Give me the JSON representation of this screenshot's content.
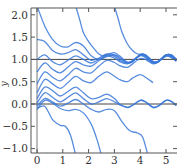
{
  "chart_data": {
    "type": "line",
    "title": "",
    "xlabel": "",
    "ylabel": "y",
    "xlim": [
      -0.22,
      5.4
    ],
    "ylim": [
      -1.1,
      2.15
    ],
    "xticks": [
      0,
      1,
      2,
      3,
      4,
      5
    ],
    "xtick_labels": [
      "0",
      "1",
      "2",
      "3",
      "4",
      "5"
    ],
    "yticks": [
      -1.0,
      -0.5,
      0.0,
      0.5,
      1.0,
      1.5,
      2.0
    ],
    "ytick_labels": [
      "−1.0",
      "−0.5",
      "0.0",
      "0.5",
      "1.0",
      "1.5",
      "2.0"
    ],
    "grid": false,
    "reference_lines": {
      "hline_y": [
        0,
        1
      ],
      "vline_x": [
        0
      ]
    },
    "line_color": "#3a78d8",
    "series": [
      {
        "name": "curve-1",
        "values": [
          [
            0,
            2.2
          ],
          [
            0.3,
            1.75
          ],
          [
            0.6,
            1.45
          ],
          [
            0.9,
            1.3
          ],
          [
            1.2,
            1.28
          ],
          [
            1.5,
            1.38
          ],
          [
            1.8,
            1.3
          ],
          [
            2.1,
            1.08
          ],
          [
            2.4,
            1.0
          ],
          [
            2.7,
            1.06
          ],
          [
            3.0,
            1.1
          ],
          [
            3.2,
            1.05
          ],
          [
            3.5,
            0.92
          ],
          [
            3.7,
            0.95
          ],
          [
            4.0,
            1.1
          ],
          [
            4.2,
            1.1
          ],
          [
            4.5,
            0.93
          ],
          [
            4.7,
            0.94
          ],
          [
            5.0,
            1.1
          ],
          [
            5.2,
            1.1
          ],
          [
            5.4,
            1.0
          ]
        ]
      },
      {
        "name": "curve-2",
        "values": [
          [
            0,
            1.45
          ],
          [
            0.3,
            1.4
          ],
          [
            0.6,
            1.2
          ],
          [
            0.9,
            1.12
          ],
          [
            1.2,
            1.15
          ],
          [
            1.5,
            1.22
          ],
          [
            1.8,
            1.1
          ],
          [
            2.1,
            0.98
          ],
          [
            2.4,
            1.03
          ],
          [
            2.7,
            1.12
          ],
          [
            3.0,
            1.1
          ],
          [
            3.2,
            1.02
          ],
          [
            3.5,
            0.93
          ],
          [
            3.7,
            0.96
          ],
          [
            4.0,
            1.1
          ],
          [
            4.2,
            1.08
          ],
          [
            4.5,
            0.93
          ],
          [
            4.7,
            0.95
          ],
          [
            5.0,
            1.1
          ],
          [
            5.2,
            1.08
          ],
          [
            5.4,
            0.98
          ]
        ]
      },
      {
        "name": "curve-3",
        "values": [
          [
            0,
            1.0
          ],
          [
            0.3,
            1.1
          ],
          [
            0.6,
            0.95
          ],
          [
            0.9,
            0.88
          ],
          [
            1.2,
            0.98
          ],
          [
            1.5,
            1.08
          ],
          [
            1.8,
            1.0
          ],
          [
            2.1,
            0.92
          ],
          [
            2.4,
            1.0
          ],
          [
            2.7,
            1.1
          ],
          [
            3.0,
            1.07
          ],
          [
            3.2,
            0.98
          ],
          [
            3.5,
            0.92
          ],
          [
            3.7,
            0.97
          ],
          [
            4.0,
            1.1
          ],
          [
            4.2,
            1.06
          ],
          [
            4.5,
            0.93
          ],
          [
            4.7,
            0.96
          ],
          [
            5.0,
            1.1
          ],
          [
            5.2,
            1.07
          ],
          [
            5.4,
            0.97
          ]
        ]
      },
      {
        "name": "curve-4",
        "values": [
          [
            0,
            0.72
          ],
          [
            0.3,
            0.92
          ],
          [
            0.6,
            0.78
          ],
          [
            0.9,
            0.7
          ],
          [
            1.2,
            0.83
          ],
          [
            1.5,
            0.95
          ],
          [
            1.8,
            0.88
          ],
          [
            2.1,
            0.85
          ],
          [
            2.4,
            0.97
          ],
          [
            2.7,
            1.08
          ],
          [
            3.0,
            1.03
          ],
          [
            3.2,
            0.95
          ],
          [
            3.5,
            0.9
          ],
          [
            3.7,
            0.97
          ],
          [
            4.0,
            1.08
          ],
          [
            4.2,
            1.04
          ],
          [
            4.5,
            0.92
          ],
          [
            4.7,
            0.96
          ],
          [
            5.0,
            1.08
          ],
          [
            5.2,
            1.05
          ],
          [
            5.4,
            0.96
          ]
        ]
      },
      {
        "name": "curve-5",
        "values": [
          [
            0,
            0.45
          ],
          [
            0.3,
            0.72
          ],
          [
            0.6,
            0.6
          ],
          [
            0.9,
            0.52
          ],
          [
            1.2,
            0.65
          ],
          [
            1.5,
            0.8
          ],
          [
            1.8,
            0.72
          ],
          [
            2.1,
            0.7
          ],
          [
            2.4,
            0.85
          ],
          [
            2.7,
            0.98
          ],
          [
            3.0,
            0.93
          ],
          [
            3.2,
            0.86
          ],
          [
            3.5,
            0.82
          ],
          [
            3.7,
            0.9
          ],
          [
            4.0,
            1.02
          ],
          [
            4.2,
            1.0
          ],
          [
            4.5,
            0.9
          ],
          [
            4.7,
            0.95
          ],
          [
            5.0,
            1.07
          ],
          [
            5.2,
            1.04
          ],
          [
            5.4,
            0.96
          ]
        ]
      },
      {
        "name": "curve-6",
        "values": [
          [
            0,
            0.25
          ],
          [
            0.3,
            0.55
          ],
          [
            0.6,
            0.45
          ],
          [
            0.9,
            0.35
          ],
          [
            1.2,
            0.48
          ],
          [
            1.5,
            0.62
          ],
          [
            1.8,
            0.52
          ],
          [
            2.1,
            0.48
          ],
          [
            2.4,
            0.62
          ],
          [
            2.7,
            0.72
          ],
          [
            3.0,
            0.62
          ],
          [
            3.2,
            0.55
          ],
          [
            3.5,
            0.5
          ],
          [
            3.7,
            0.58
          ],
          [
            4.0,
            0.66
          ],
          [
            4.2,
            0.6
          ],
          [
            4.5,
            0.48
          ]
        ]
      },
      {
        "name": "curve-7",
        "values": [
          [
            0,
            0.12
          ],
          [
            0.3,
            0.38
          ],
          [
            0.6,
            0.3
          ],
          [
            0.9,
            0.18
          ],
          [
            1.2,
            0.28
          ],
          [
            1.5,
            0.38
          ],
          [
            1.8,
            0.25
          ],
          [
            2.1,
            0.12
          ],
          [
            2.4,
            0.15
          ],
          [
            2.7,
            0.22
          ],
          [
            3.0,
            0.12
          ],
          [
            3.2,
            0.0
          ],
          [
            3.5,
            -0.08
          ],
          [
            3.7,
            -0.03
          ],
          [
            4.0,
            0.08
          ],
          [
            4.2,
            0.05
          ],
          [
            4.5,
            -0.08
          ],
          [
            4.7,
            -0.05
          ],
          [
            5.0,
            0.08
          ],
          [
            5.2,
            0.06
          ],
          [
            5.4,
            -0.04
          ]
        ]
      },
      {
        "name": "curve-8",
        "values": [
          [
            0,
            0.02
          ],
          [
            0.3,
            0.25
          ],
          [
            0.6,
            0.15
          ],
          [
            0.9,
            0.05
          ],
          [
            1.2,
            0.15
          ],
          [
            1.5,
            0.25
          ],
          [
            1.8,
            0.12
          ],
          [
            2.1,
            0.0
          ],
          [
            2.4,
            0.05
          ],
          [
            2.7,
            0.12
          ],
          [
            3.0,
            0.05
          ],
          [
            3.2,
            -0.02
          ],
          [
            3.5,
            -0.07
          ],
          [
            3.7,
            -0.03
          ],
          [
            4.0,
            0.08
          ],
          [
            4.2,
            0.05
          ],
          [
            4.5,
            -0.07
          ],
          [
            4.7,
            -0.04
          ],
          [
            5.0,
            0.08
          ],
          [
            5.2,
            0.06
          ],
          [
            5.4,
            -0.03
          ]
        ]
      },
      {
        "name": "curve-9",
        "values": [
          [
            0,
            -0.05
          ],
          [
            0.3,
            0.12
          ],
          [
            0.6,
            0.05
          ],
          [
            0.9,
            -0.05
          ],
          [
            1.2,
            0.02
          ],
          [
            1.5,
            0.1
          ],
          [
            1.8,
            0.0
          ],
          [
            2.1,
            -0.12
          ],
          [
            2.4,
            -0.18
          ],
          [
            2.7,
            -0.12
          ],
          [
            3.0,
            -0.15
          ],
          [
            3.3,
            -0.4
          ],
          [
            3.6,
            -0.6
          ],
          [
            3.9,
            -0.65
          ],
          [
            4.1,
            -0.75
          ],
          [
            4.3,
            -1.15
          ]
        ]
      },
      {
        "name": "curve-10",
        "values": [
          [
            0,
            -0.12
          ],
          [
            0.3,
            0.08
          ],
          [
            0.6,
            0.02
          ],
          [
            0.9,
            -0.1
          ],
          [
            1.2,
            -0.15
          ],
          [
            1.5,
            -0.12
          ],
          [
            1.8,
            -0.2
          ],
          [
            2.1,
            -0.45
          ],
          [
            2.3,
            -0.75
          ],
          [
            2.5,
            -1.15
          ]
        ]
      },
      {
        "name": "curve-11",
        "values": [
          [
            0,
            -0.1
          ],
          [
            0.3,
            -0.05
          ],
          [
            0.6,
            -0.35
          ],
          [
            0.9,
            -0.48
          ],
          [
            1.1,
            -0.5
          ],
          [
            1.3,
            -0.7
          ],
          [
            1.5,
            -1.15
          ]
        ]
      },
      {
        "name": "curve-12",
        "values": [
          [
            1.5,
            2.2
          ],
          [
            1.65,
            1.9
          ],
          [
            1.8,
            1.6
          ],
          [
            2.0,
            1.4
          ],
          [
            2.2,
            1.25
          ],
          [
            2.4,
            1.12
          ],
          [
            2.6,
            1.08
          ],
          [
            2.8,
            1.12
          ],
          [
            3.0,
            1.15
          ],
          [
            3.2,
            1.08
          ],
          [
            3.5,
            0.94
          ],
          [
            3.7,
            0.95
          ],
          [
            4.0,
            1.1
          ],
          [
            4.2,
            1.1
          ],
          [
            4.5,
            0.94
          ],
          [
            4.7,
            0.95
          ],
          [
            5.0,
            1.1
          ],
          [
            5.2,
            1.1
          ],
          [
            5.4,
            1.0
          ]
        ]
      },
      {
        "name": "curve-13",
        "values": [
          [
            3.0,
            2.2
          ],
          [
            3.15,
            1.9
          ],
          [
            3.3,
            1.6
          ],
          [
            3.5,
            1.35
          ],
          [
            3.7,
            1.2
          ],
          [
            3.9,
            1.12
          ],
          [
            4.1,
            1.12
          ],
          [
            4.3,
            1.06
          ],
          [
            4.5,
            0.96
          ],
          [
            4.7,
            0.96
          ],
          [
            5.0,
            1.1
          ],
          [
            5.2,
            1.1
          ],
          [
            5.4,
            1.0
          ]
        ]
      }
    ]
  }
}
